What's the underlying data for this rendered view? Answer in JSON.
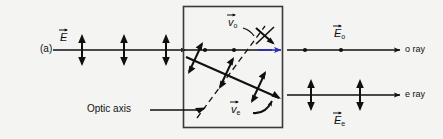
{
  "figure": {
    "panel_label": "(a)",
    "background_color": "#f4f4f2",
    "ink_color": "#101010",
    "accent_color": "#2b2bbb"
  },
  "incident": {
    "field_label": "E",
    "field_subscript": "",
    "polarization_marks": 3,
    "polarization_type": "vertical-double-arrow"
  },
  "crystal": {
    "name": "birefringent-crystal",
    "optic_axis_label": "Optic axis",
    "optic_axis_style": "dashed",
    "o_velocity_label": "v",
    "o_velocity_subscript": "o",
    "e_velocity_label": "v",
    "e_velocity_subscript": "e",
    "o_ray_marks": 2,
    "e_ray_marks": 3
  },
  "output": {
    "o_ray": {
      "name": "o ray",
      "label": "o ray",
      "field_label": "E",
      "field_subscript": "o",
      "polarization_marks": 2,
      "polarization_type": "dot"
    },
    "e_ray": {
      "name": "e ray",
      "label": "e ray",
      "field_label": "E",
      "field_subscript": "e",
      "polarization_marks": 2,
      "polarization_type": "vertical-double-arrow"
    }
  }
}
